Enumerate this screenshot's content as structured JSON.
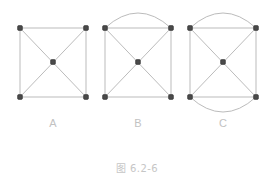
{
  "figure": {
    "caption": "图 6.2-6",
    "background_color": "#ffffff",
    "edge_color": "#b3b3b3",
    "vertex_color": "#4a4a4a",
    "label_color": "#c2c2c2",
    "caption_color": "#c6c6c6"
  },
  "panels": [
    {
      "id": "A",
      "label": "A",
      "description": "square with four corner vertices, one center vertex, two diagonals",
      "square": {
        "left": 20,
        "top": 28,
        "right": 86,
        "bottom": 97
      },
      "vertices": [
        {
          "name": "top-left",
          "x": 20,
          "y": 28
        },
        {
          "name": "top-right",
          "x": 86,
          "y": 28
        },
        {
          "name": "bottom-left",
          "x": 20,
          "y": 97
        },
        {
          "name": "bottom-right",
          "x": 86,
          "y": 97
        },
        {
          "name": "center",
          "x": 53,
          "y": 62
        }
      ],
      "arcs": []
    },
    {
      "id": "B",
      "label": "B",
      "description": "square with diagonals plus one arc above the top edge",
      "square": {
        "left": 105,
        "top": 28,
        "right": 171,
        "bottom": 97
      },
      "vertices": [
        {
          "name": "top-left",
          "x": 105,
          "y": 28
        },
        {
          "name": "top-right",
          "x": 171,
          "y": 28
        },
        {
          "name": "bottom-left",
          "x": 105,
          "y": 97
        },
        {
          "name": "bottom-right",
          "x": 171,
          "y": 97
        },
        {
          "name": "center",
          "x": 138,
          "y": 62
        }
      ],
      "arcs": [
        {
          "name": "top-arc",
          "side": "top",
          "bulge": 15
        }
      ]
    },
    {
      "id": "C",
      "label": "C",
      "description": "square with diagonals plus arcs above the top edge and below the bottom edge",
      "square": {
        "left": 190,
        "top": 28,
        "right": 256,
        "bottom": 97
      },
      "vertices": [
        {
          "name": "top-left",
          "x": 190,
          "y": 28
        },
        {
          "name": "top-right",
          "x": 256,
          "y": 28
        },
        {
          "name": "bottom-left",
          "x": 190,
          "y": 97
        },
        {
          "name": "bottom-right",
          "x": 256,
          "y": 97
        },
        {
          "name": "center",
          "x": 223,
          "y": 62
        }
      ],
      "arcs": [
        {
          "name": "top-arc",
          "side": "top",
          "bulge": 15
        },
        {
          "name": "bottom-arc",
          "side": "bottom",
          "bulge": 15
        }
      ]
    }
  ]
}
